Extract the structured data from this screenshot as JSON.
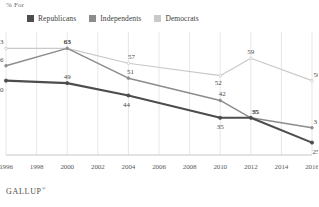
{
  "header": {
    "axis_title": "% For"
  },
  "legend": {
    "position": "top-left",
    "items": [
      {
        "label": "Republicans",
        "color": "#4d4d4d"
      },
      {
        "label": "Independents",
        "color": "#8c8c8c"
      },
      {
        "label": "Democrats",
        "color": "#c9c9c9"
      }
    ]
  },
  "footer": {
    "brand": "GALLUP",
    "mark": "®"
  },
  "chart_data": {
    "type": "line",
    "title": "",
    "subtitle": "",
    "xlabel": "",
    "ylabel": "% For",
    "xlim": [
      1996,
      2016
    ],
    "ylim": [
      20,
      68
    ],
    "grid": "vertical",
    "legend_position": "top-left",
    "tick_labels": [
      "1996",
      "1998",
      "2000",
      "2002",
      "2004",
      "2006",
      "2008",
      "2010",
      "2012",
      "2014",
      "2016"
    ],
    "x": [
      1996,
      2000,
      2004,
      2010,
      2012,
      2016
    ],
    "series": [
      {
        "name": "Republicans",
        "color": "#4d4d4d",
        "x": [
          1996,
          2000,
          2004,
          2010,
          2012,
          2016
        ],
        "values": [
          50,
          49,
          44,
          35,
          35,
          25
        ],
        "labels": [
          "50",
          "49",
          "44",
          "35",
          "35",
          "25"
        ]
      },
      {
        "name": "Independents",
        "color": "#8c8c8c",
        "x": [
          1996,
          2000,
          2004,
          2010,
          2012,
          2016
        ],
        "values": [
          56,
          63,
          51,
          42,
          35,
          31
        ],
        "labels": [
          "56",
          "63",
          "51",
          "42",
          "35",
          "31"
        ]
      },
      {
        "name": "Democrats",
        "color": "#c9c9c9",
        "x": [
          1996,
          2000,
          2004,
          2010,
          2012,
          2016
        ],
        "values": [
          63,
          63,
          57,
          52,
          59,
          50
        ],
        "labels": [
          "63",
          "63",
          "57",
          "52",
          "59",
          "50"
        ]
      }
    ]
  }
}
